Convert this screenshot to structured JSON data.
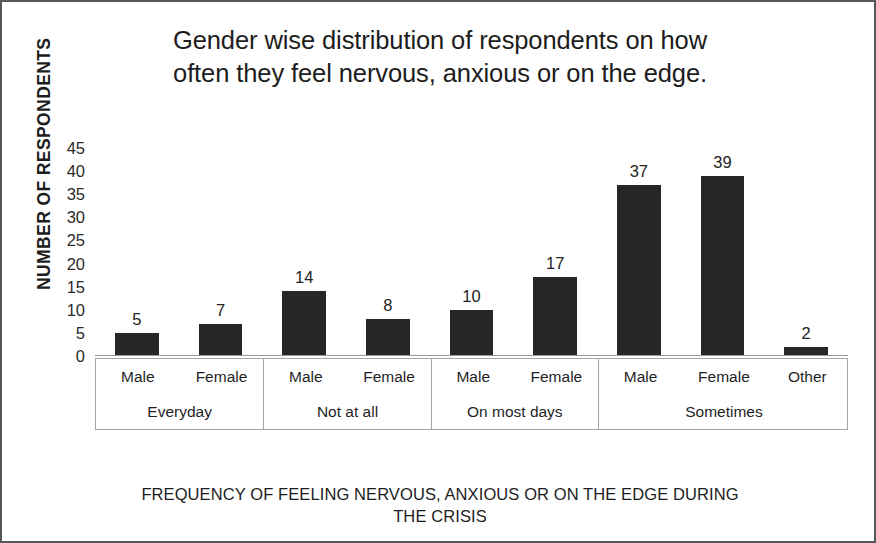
{
  "chart_data": {
    "type": "bar",
    "title": "Gender wise distribution of respondents on how often they feel nervous, anxious or on the edge.",
    "title_line1": "Gender wise distribution of respondents on how",
    "title_line2": "often they feel nervous, anxious or on the edge.",
    "xlabel": "FREQUENCY OF FEELING NERVOUS, ANXIOUS OR ON THE EDGE DURING THE CRISIS",
    "xlabel_line1": "FREQUENCY OF FEELING NERVOUS, ANXIOUS OR ON THE EDGE DURING",
    "xlabel_line2": "THE CRISIS",
    "ylabel": "NUMBER OF RESPONDENTS",
    "ylim": [
      0,
      45
    ],
    "yticks": [
      45,
      40,
      35,
      30,
      25,
      20,
      15,
      10,
      5,
      0
    ],
    "grid": false,
    "legend": false,
    "bar_color": "#262626",
    "categories": [
      "Everyday - Male",
      "Everyday - Female",
      "Not at all - Male",
      "Not at all - Female",
      "On most days - Male",
      "On most days - Female",
      "Sometimes - Male",
      "Sometimes - Female",
      "Sometimes - Other"
    ],
    "values": [
      5,
      7,
      14,
      8,
      10,
      17,
      37,
      39,
      2
    ],
    "groups": [
      {
        "label": "Everyday",
        "genders": [
          "Male",
          "Female"
        ],
        "values": [
          5,
          7
        ]
      },
      {
        "label": "Not at all",
        "genders": [
          "Male",
          "Female"
        ],
        "values": [
          14,
          8
        ]
      },
      {
        "label": "On most days",
        "genders": [
          "Male",
          "Female"
        ],
        "values": [
          10,
          17
        ]
      },
      {
        "label": "Sometimes",
        "genders": [
          "Male",
          "Female",
          "Other"
        ],
        "values": [
          37,
          39,
          2
        ]
      }
    ]
  }
}
